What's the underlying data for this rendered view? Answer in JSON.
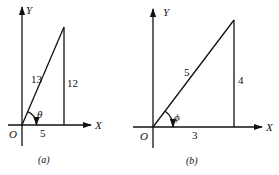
{
  "figure": {
    "panels": [
      {
        "id": "a",
        "caption": "(a)",
        "axes": {
          "x_label": "X",
          "y_label": "Y",
          "origin_label": "O"
        },
        "triangle": {
          "hypotenuse": "13",
          "opposite": "12",
          "adjacent": "5"
        },
        "angle_label": "θ"
      },
      {
        "id": "b",
        "caption": "(b)",
        "axes": {
          "x_label": "X",
          "y_label": "Y",
          "origin_label": "O"
        },
        "triangle": {
          "hypotenuse": "5",
          "opposite": "4",
          "adjacent": "3"
        },
        "angle_label": "ϕ"
      }
    ]
  }
}
